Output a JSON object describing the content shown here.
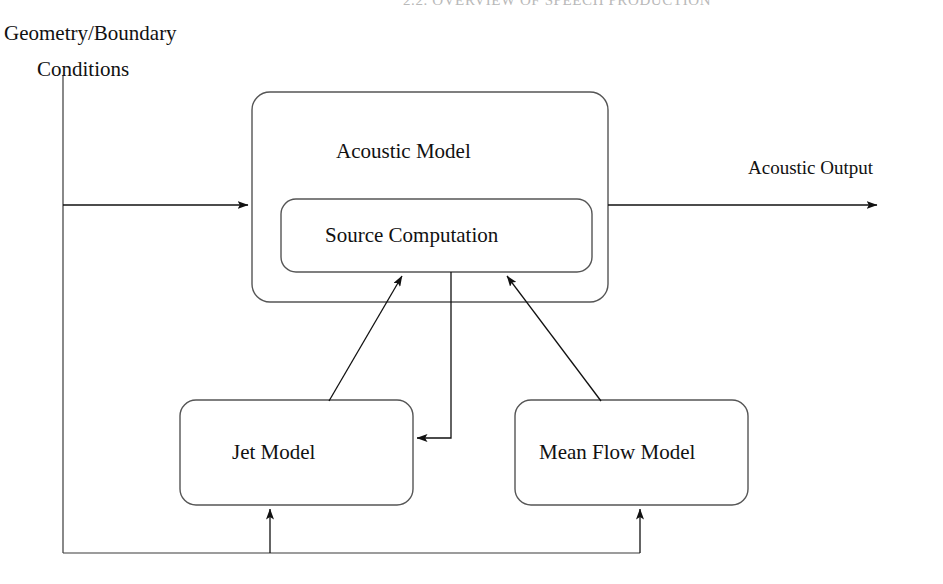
{
  "page": {
    "running_header": "2.2. OVERVIEW OF SPEECH PRODUCTION",
    "background_color": "#ffffff",
    "stroke_color": "#1a1a1a",
    "text_color": "#111111"
  },
  "diagram": {
    "type": "block-diagram",
    "inputs": [
      {
        "id": "geometry-boundary-conditions",
        "line1": "Geometry/Boundary",
        "line2": "Conditions"
      }
    ],
    "outputs": [
      {
        "id": "acoustic-output",
        "label": "Acoustic Output"
      }
    ],
    "blocks": [
      {
        "id": "acoustic-model",
        "label": "Acoustic Model",
        "x": 252,
        "y": 92,
        "width": 356,
        "height": 210
      },
      {
        "id": "source-computation",
        "label": "Source Computation",
        "x": 281,
        "y": 199,
        "width": 311,
        "height": 73
      },
      {
        "id": "jet-model",
        "label": "Jet Model",
        "x": 180,
        "y": 400,
        "width": 233,
        "height": 105
      },
      {
        "id": "mean-flow-model",
        "label": "Mean Flow Model",
        "x": 515,
        "y": 400,
        "width": 233,
        "height": 105
      }
    ],
    "connections": [
      {
        "id": "geometry-to-acoustic-model",
        "from": "geometry-boundary-conditions",
        "to": "acoustic-model",
        "arrow": true
      },
      {
        "id": "acoustic-model-to-output",
        "from": "acoustic-model",
        "to": "acoustic-output",
        "arrow": true
      },
      {
        "id": "jet-model-to-source-computation",
        "from": "jet-model",
        "to": "source-computation",
        "arrow": true
      },
      {
        "id": "mean-flow-model-to-source-computation",
        "from": "mean-flow-model",
        "to": "source-computation",
        "arrow": true
      },
      {
        "id": "source-computation-to-jet-model",
        "from": "source-computation",
        "to": "jet-model",
        "arrow": true
      },
      {
        "id": "geometry-to-jet-model",
        "from": "geometry-boundary-conditions",
        "to": "jet-model",
        "arrow": true
      },
      {
        "id": "geometry-to-mean-flow-model",
        "from": "geometry-boundary-conditions",
        "to": "mean-flow-model",
        "arrow": true
      }
    ]
  }
}
